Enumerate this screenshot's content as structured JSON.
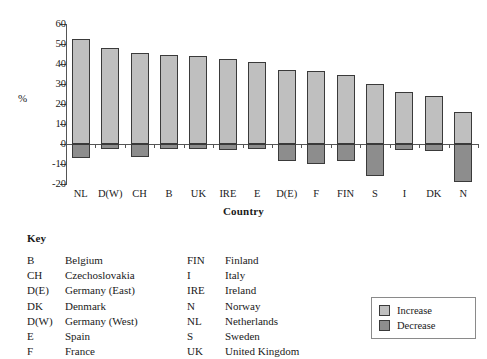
{
  "chart_data": {
    "type": "bar",
    "title": "",
    "xlabel": "Country",
    "ylabel": "%",
    "ylim": [
      -20,
      60
    ],
    "yticks": [
      60,
      50,
      40,
      30,
      20,
      10,
      0,
      -10,
      -20
    ],
    "ytick_labels": [
      "60",
      "50",
      "40",
      "30",
      "20",
      "10",
      "0",
      "-10",
      "-20"
    ],
    "grid": false,
    "legend_position": "bottom-right",
    "categories": [
      "NL",
      "D(W)",
      "CH",
      "B",
      "UK",
      "IRE",
      "E",
      "D(E)",
      "F",
      "FIN",
      "S",
      "I",
      "DK",
      "N"
    ],
    "series": [
      {
        "name": "Increase",
        "color": "#bfbfbf",
        "values": [
          52.5,
          48,
          45.5,
          44.5,
          44,
          42.5,
          41,
          37,
          36.5,
          34.5,
          30,
          26,
          24,
          16
        ]
      },
      {
        "name": "Decrease",
        "color": "#8d8d8d",
        "values": [
          -7,
          -2.5,
          -6.5,
          -2.5,
          -2.5,
          -3,
          -2.5,
          -8.5,
          -10,
          -8.5,
          -16,
          -3,
          -3.5,
          -19
        ]
      }
    ]
  },
  "axis": {
    "y_label": "%",
    "x_title": "Country"
  },
  "key": {
    "title": "Key",
    "left_column": [
      {
        "abbr": "B",
        "name": "Belgium"
      },
      {
        "abbr": "CH",
        "name": "Czechoslovakia"
      },
      {
        "abbr": "D(E)",
        "name": "Germany (East)"
      },
      {
        "abbr": "DK",
        "name": "Denmark"
      },
      {
        "abbr": "D(W)",
        "name": "Germany (West)"
      },
      {
        "abbr": "E",
        "name": "Spain"
      },
      {
        "abbr": "F",
        "name": "France"
      }
    ],
    "right_column": [
      {
        "abbr": "FIN",
        "name": "Finland"
      },
      {
        "abbr": "I",
        "name": "Italy"
      },
      {
        "abbr": "IRE",
        "name": "Ireland"
      },
      {
        "abbr": "N",
        "name": "Norway"
      },
      {
        "abbr": "NL",
        "name": "Netherlands"
      },
      {
        "abbr": "S",
        "name": "Sweden"
      },
      {
        "abbr": "UK",
        "name": "United Kingdom"
      }
    ]
  },
  "legend": {
    "items": [
      {
        "label": "Increase",
        "color": "#bfbfbf"
      },
      {
        "label": "Decrease",
        "color": "#8d8d8d"
      }
    ]
  }
}
